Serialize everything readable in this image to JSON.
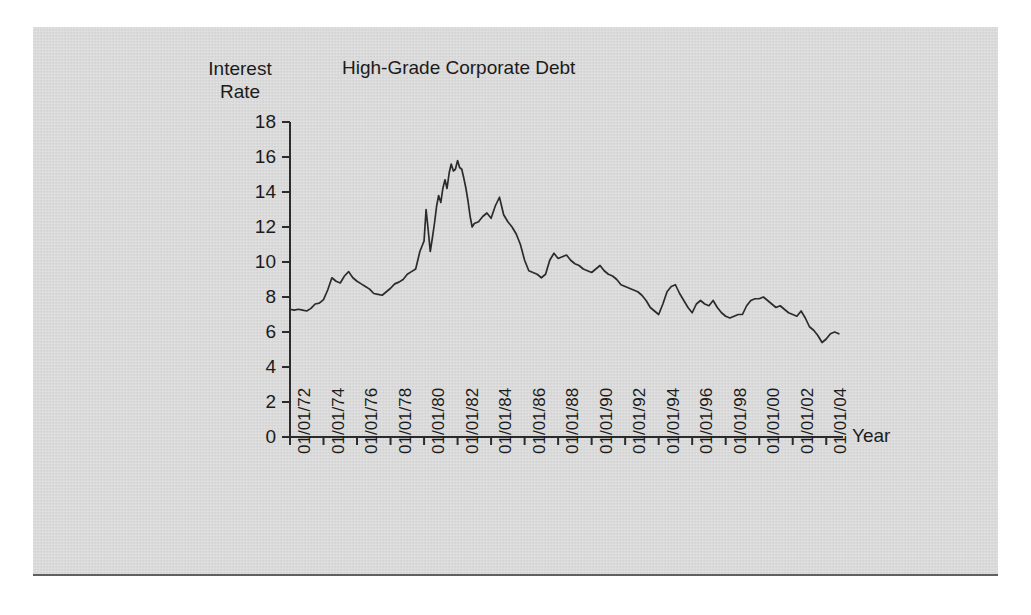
{
  "figure": {
    "background_color": "#d6d6d6",
    "page_color": "#ffffff",
    "line_color": "#2b2b2b",
    "text_color": "#1b1b1b"
  },
  "chart_data": {
    "type": "line",
    "title": "High-Grade Corporate Debt",
    "ylabel_line1": "Interest",
    "ylabel_line2": "Rate",
    "xlabel": "Year",
    "grid": false,
    "legend": "none",
    "ylim": [
      0,
      18
    ],
    "yticks": [
      0,
      2,
      4,
      6,
      8,
      10,
      12,
      14,
      16,
      18
    ],
    "ytick_labels": [
      "0",
      "2",
      "4",
      "6",
      "8",
      "10",
      "12",
      "14",
      "16",
      "18"
    ],
    "xlim": [
      "01/01/72",
      "01/01/05"
    ],
    "xtick_labels": [
      "01/01/72",
      "01/01/74",
      "01/01/76",
      "01/01/78",
      "01/01/80",
      "01/01/82",
      "01/01/84",
      "01/01/86",
      "01/01/88",
      "01/01/90",
      "01/01/92",
      "01/01/94",
      "01/01/96",
      "01/01/98",
      "01/01/00",
      "01/01/02",
      "01/01/04"
    ],
    "series": [
      {
        "name": "High-Grade Corporate Debt Yield",
        "units": "percent",
        "x": [
          1972.0,
          1972.25,
          1972.5,
          1972.75,
          1973.0,
          1973.25,
          1973.5,
          1973.75,
          1974.0,
          1974.25,
          1974.5,
          1974.75,
          1975.0,
          1975.25,
          1975.5,
          1975.75,
          1976.0,
          1976.25,
          1976.5,
          1976.75,
          1977.0,
          1977.25,
          1977.5,
          1977.75,
          1978.0,
          1978.25,
          1978.5,
          1978.75,
          1979.0,
          1979.25,
          1979.5,
          1979.75,
          1980.0,
          1980.12,
          1980.25,
          1980.37,
          1980.5,
          1980.62,
          1980.75,
          1980.87,
          1981.0,
          1981.12,
          1981.25,
          1981.37,
          1981.5,
          1981.62,
          1981.75,
          1981.87,
          1982.0,
          1982.12,
          1982.25,
          1982.37,
          1982.5,
          1982.62,
          1982.75,
          1982.87,
          1983.0,
          1983.25,
          1983.5,
          1983.75,
          1984.0,
          1984.25,
          1984.5,
          1984.75,
          1985.0,
          1985.25,
          1985.5,
          1985.75,
          1986.0,
          1986.25,
          1986.5,
          1986.75,
          1987.0,
          1987.25,
          1987.5,
          1987.75,
          1988.0,
          1988.25,
          1988.5,
          1988.75,
          1989.0,
          1989.25,
          1989.5,
          1989.75,
          1990.0,
          1990.25,
          1990.5,
          1990.75,
          1991.0,
          1991.25,
          1991.5,
          1991.75,
          1992.0,
          1992.25,
          1992.5,
          1992.75,
          1993.0,
          1993.25,
          1993.5,
          1993.75,
          1994.0,
          1994.25,
          1994.5,
          1994.75,
          1995.0,
          1995.25,
          1995.5,
          1995.75,
          1996.0,
          1996.25,
          1996.5,
          1996.75,
          1997.0,
          1997.25,
          1997.5,
          1997.75,
          1998.0,
          1998.25,
          1998.5,
          1998.75,
          1999.0,
          1999.25,
          1999.5,
          1999.75,
          2000.0,
          2000.25,
          2000.5,
          2000.75,
          2001.0,
          2001.25,
          2001.5,
          2001.75,
          2002.0,
          2002.25,
          2002.5,
          2002.75,
          2003.0,
          2003.25,
          2003.5,
          2003.75,
          2004.0,
          2004.25,
          2004.5,
          2004.75
        ],
        "y": [
          7.3,
          7.25,
          7.3,
          7.25,
          7.2,
          7.35,
          7.6,
          7.65,
          7.85,
          8.4,
          9.1,
          8.9,
          8.8,
          9.2,
          9.45,
          9.1,
          8.9,
          8.75,
          8.6,
          8.45,
          8.2,
          8.15,
          8.1,
          8.3,
          8.5,
          8.75,
          8.85,
          9.0,
          9.3,
          9.45,
          9.6,
          10.6,
          11.2,
          13.0,
          11.8,
          10.6,
          11.4,
          12.2,
          13.2,
          13.8,
          13.4,
          14.2,
          14.7,
          14.2,
          15.1,
          15.6,
          15.2,
          15.3,
          15.8,
          15.4,
          15.3,
          14.8,
          14.2,
          13.5,
          12.6,
          12.0,
          12.2,
          12.3,
          12.6,
          12.8,
          12.5,
          13.2,
          13.7,
          12.7,
          12.3,
          12.0,
          11.6,
          11.0,
          10.1,
          9.5,
          9.4,
          9.3,
          9.1,
          9.3,
          10.1,
          10.5,
          10.2,
          10.3,
          10.4,
          10.1,
          9.9,
          9.8,
          9.6,
          9.5,
          9.4,
          9.6,
          9.8,
          9.5,
          9.3,
          9.2,
          9.0,
          8.7,
          8.6,
          8.5,
          8.4,
          8.3,
          8.1,
          7.8,
          7.4,
          7.2,
          7.0,
          7.6,
          8.3,
          8.6,
          8.7,
          8.2,
          7.8,
          7.4,
          7.1,
          7.6,
          7.8,
          7.6,
          7.5,
          7.8,
          7.4,
          7.1,
          6.9,
          6.8,
          6.9,
          7.0,
          7.0,
          7.5,
          7.8,
          7.9,
          7.9,
          8.0,
          7.8,
          7.6,
          7.4,
          7.5,
          7.3,
          7.1,
          7.0,
          6.9,
          7.2,
          6.8,
          6.3,
          6.1,
          5.8,
          5.4,
          5.6,
          5.9,
          6.0,
          5.9
        ]
      }
    ],
    "notes": {
      "peak_value": 15.8,
      "peak_date": "01/01/82",
      "start_value": 7.3,
      "end_value": 5.9,
      "trough_value": 5.4,
      "trough_date": "mid-2003"
    }
  }
}
